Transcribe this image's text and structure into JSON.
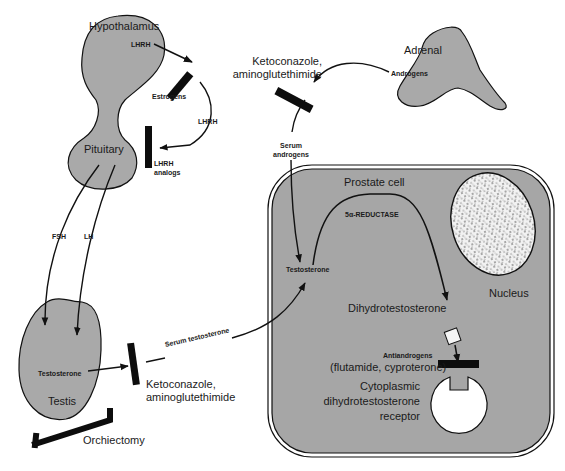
{
  "organs": {
    "hypothalamus": "Hypothalamus",
    "pituitary": "Pituitary",
    "testis": "Testis",
    "adrenal": "Adrenal",
    "prostate_cell": "Prostate cell",
    "nucleus": "Nucleus"
  },
  "hormones": {
    "lhrh_top": "LHRH",
    "lhrh_loop": "LHRH",
    "fsh": "FSH",
    "lh": "LH",
    "testosterone_testis": "Testosterone",
    "serum_testosterone": "Serum testosterone",
    "androgens": "Androgens",
    "serum_androgens_1": "Serum",
    "serum_androgens_2": "androgens",
    "testosterone_cell": "Testosterone",
    "reductase": "5α-REDUCTASE",
    "dht": "Dihydrotestosterone"
  },
  "blockers": {
    "estrogens": "Estrogens",
    "lhrh_analogs_1": "LHRH",
    "lhrh_analogs_2": "analogs",
    "keto_top_1": "Ketoconazole,",
    "keto_top_2": "aminoglutethimide",
    "keto_bottom_1": "Ketoconazole,",
    "keto_bottom_2": "aminoglutethimide",
    "orchiectomy": "Orchiectomy",
    "antiandrogens": "Antiandrogens",
    "antiandrogens_drugs": "(flutamide, cyproterone)"
  },
  "receptor": {
    "line1": "Cytoplasmic",
    "line2": "dihydrotestosterone",
    "line3": "receptor"
  },
  "colors": {
    "organ_fill": "#a9a9a9",
    "cell_fill": "#a6a6a6",
    "stroke": "#111111",
    "blocker": "#0d0d0d"
  }
}
